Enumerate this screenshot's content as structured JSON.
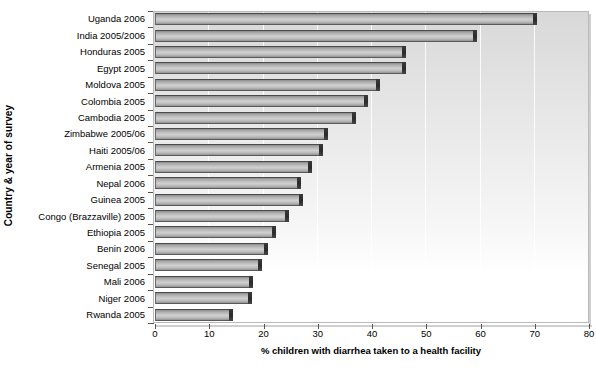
{
  "chart_data": {
    "type": "bar",
    "orientation": "horizontal",
    "title": "",
    "xlabel": "% children with diarrhea taken to a health facility",
    "ylabel": "Country & year of survey",
    "xlim": [
      0,
      80
    ],
    "xticks": [
      0,
      10,
      20,
      30,
      40,
      50,
      60,
      70,
      80
    ],
    "xtick_labels": [
      "0",
      "10",
      "20",
      "30",
      "40",
      "50",
      "60",
      "70",
      "80"
    ],
    "grid": "vertical-faint",
    "legend": "none",
    "categories": [
      "Uganda 2006",
      "India 2005/2006",
      "Honduras 2005",
      "Egypt 2005",
      "Moldova 2005",
      "Colombia 2005",
      "Cambodia 2005",
      "Zimbabwe 2005/06",
      "Haiti 2005/06",
      "Armenia 2005",
      "Nepal 2006",
      "Guinea 2005",
      "Congo (Brazzaville) 2005",
      "Ethiopia 2005",
      "Benin 2006",
      "Senegal 2005",
      "Mali 2006",
      "Niger 2006",
      "Rwanda 2005"
    ],
    "values": [
      70.5,
      59.4,
      46.3,
      46.3,
      41.5,
      39.3,
      37.0,
      31.8,
      30.9,
      28.9,
      26.9,
      27.2,
      24.7,
      22.3,
      20.8,
      19.8,
      18.1,
      17.8,
      14.4
    ],
    "bar_fill_color": "#c2c2c2",
    "bar_edge_color": "#4a4a4a",
    "plot_background": "#e6e6e6"
  }
}
